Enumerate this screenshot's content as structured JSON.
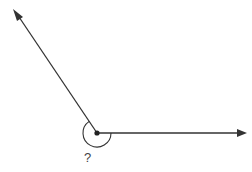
{
  "diagram": {
    "type": "angle",
    "angle_label": "?",
    "marked_angle_kind": "reflex",
    "rays": [
      {
        "name": "upper-left-ray",
        "direction_deg": 124
      },
      {
        "name": "right-ray",
        "direction_deg": 0
      }
    ],
    "colors": {
      "line": "#333333",
      "vertex": "#222222",
      "label": "#444444"
    }
  }
}
